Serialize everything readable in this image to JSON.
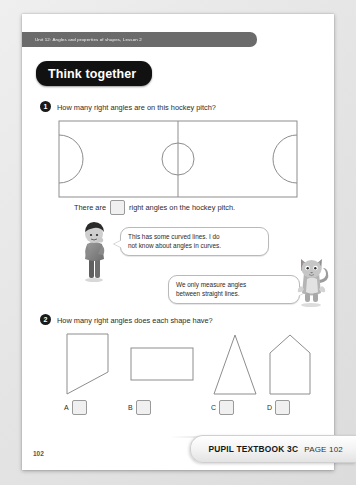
{
  "page": {
    "running_head": "Unit 12: Angles and properties of shapes, Lesson 2",
    "banner_title": "Think together",
    "folio": "102"
  },
  "questions": [
    {
      "number": "1",
      "text": "How many right angles are on this hockey pitch?",
      "answer_sentence_before": "There are",
      "answer_sentence_after": "right angles on the hockey pitch.",
      "answer_value": "",
      "figure": "hockey-pitch"
    },
    {
      "number": "2",
      "text": "How many right angles does each shape have?",
      "shapes": [
        {
          "label": "A",
          "name": "right-trapezium",
          "answer_value": ""
        },
        {
          "label": "B",
          "name": "rectangle",
          "answer_value": ""
        },
        {
          "label": "C",
          "name": "triangle",
          "answer_value": ""
        },
        {
          "label": "D",
          "name": "pentagon-house",
          "answer_value": ""
        }
      ]
    }
  ],
  "speech_bubbles": [
    {
      "speaker": "child",
      "line1": "This has some curved lines. I do",
      "line2": "not know about angles in curves."
    },
    {
      "speaker": "cat",
      "line1": "We only measure angles",
      "line2": "between straight lines."
    }
  ],
  "footer": {
    "book": "PUPIL TEXTBOOK 3C",
    "page": "PAGE 102"
  },
  "colors": {
    "page_bg": "#ffffff",
    "outer_bg": "#e9e9e9",
    "banner_bg": "#111111",
    "strip_bg": "#6b6b6b",
    "line": "#8d8d8d",
    "box_fill": "#f0f0f0"
  }
}
